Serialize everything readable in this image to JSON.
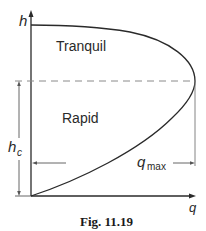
{
  "figure": {
    "caption": "Fig. 11.19",
    "axes": {
      "y_label": "h",
      "x_label": "q"
    },
    "regions": {
      "upper": "Tranquil",
      "lower": "Rapid"
    },
    "annotations": {
      "critical_depth": "h",
      "critical_depth_sub": "c",
      "max_flow": "q",
      "max_flow_sub": "max"
    },
    "colors": {
      "line": "#2a2a2a",
      "dashed": "#8a8a8a",
      "dimension": "#555555"
    }
  }
}
